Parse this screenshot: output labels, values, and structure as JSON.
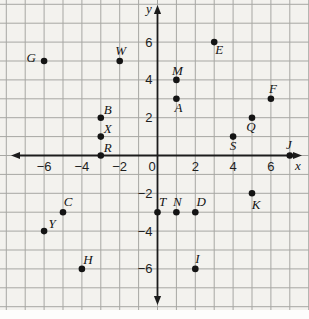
{
  "figure": {
    "name": "coordinate-plane-with-labeled-points",
    "colors": {
      "paper": "#f3f2ee",
      "grid": "#a7a7a3",
      "axis": "#1c1c1c",
      "point": "#141414",
      "margin": "#fdfdfc"
    }
  },
  "chart_data": {
    "type": "scatter",
    "title": "",
    "xlabel": "x",
    "ylabel": "y",
    "xlim": [
      -8,
      8
    ],
    "ylim": [
      -8,
      8
    ],
    "grid": true,
    "x_tick_labels": [
      {
        "value": -6,
        "text": "−6"
      },
      {
        "value": -4,
        "text": "−4"
      },
      {
        "value": -2,
        "text": "−2"
      },
      {
        "value": 0,
        "text": "0"
      },
      {
        "value": 2,
        "text": "2"
      },
      {
        "value": 4,
        "text": "4"
      },
      {
        "value": 6,
        "text": "6"
      }
    ],
    "y_tick_labels": [
      {
        "value": 6,
        "text": "6"
      },
      {
        "value": 4,
        "text": "4"
      },
      {
        "value": 2,
        "text": "2"
      },
      {
        "value": -2,
        "text": "−2"
      },
      {
        "value": -4,
        "text": "−4"
      },
      {
        "value": -6,
        "text": "−6"
      }
    ],
    "points": [
      {
        "label": "G",
        "x": -6,
        "y": 5,
        "label_offset": [
          -13,
          1
        ]
      },
      {
        "label": "W",
        "x": -2,
        "y": 5,
        "label_offset": [
          1,
          -6
        ]
      },
      {
        "label": "E",
        "x": 3,
        "y": 6,
        "label_offset": [
          5,
          12
        ]
      },
      {
        "label": "M",
        "x": 1,
        "y": 4,
        "label_offset": [
          1,
          -5
        ]
      },
      {
        "label": "A",
        "x": 1,
        "y": 3,
        "label_offset": [
          2,
          13
        ]
      },
      {
        "label": "F",
        "x": 6,
        "y": 3,
        "label_offset": [
          2,
          -6
        ]
      },
      {
        "label": "B",
        "x": -3,
        "y": 2,
        "label_offset": [
          7,
          -4
        ]
      },
      {
        "label": "X",
        "x": -3,
        "y": 1,
        "label_offset": [
          7,
          -4
        ]
      },
      {
        "label": "R",
        "x": -3,
        "y": 0,
        "label_offset": [
          7,
          -4
        ]
      },
      {
        "label": "Q",
        "x": 5,
        "y": 2,
        "label_offset": [
          -1,
          13
        ]
      },
      {
        "label": "S",
        "x": 4,
        "y": 1,
        "label_offset": [
          0,
          13
        ]
      },
      {
        "label": "J",
        "x": 7,
        "y": 0,
        "label_offset": [
          -1,
          -7
        ]
      },
      {
        "label": "C",
        "x": -5,
        "y": -3,
        "label_offset": [
          5,
          -6
        ]
      },
      {
        "label": "Y",
        "x": -6,
        "y": -4,
        "label_offset": [
          8,
          -3
        ]
      },
      {
        "label": "T",
        "x": 0,
        "y": -3,
        "label_offset": [
          5,
          -6
        ]
      },
      {
        "label": "N",
        "x": 1,
        "y": -3,
        "label_offset": [
          1,
          -6
        ]
      },
      {
        "label": "D",
        "x": 2,
        "y": -3,
        "label_offset": [
          6,
          -6
        ]
      },
      {
        "label": "K",
        "x": 5,
        "y": -2,
        "label_offset": [
          4,
          16
        ]
      },
      {
        "label": "H",
        "x": -4,
        "y": -6,
        "label_offset": [
          6,
          -5
        ]
      },
      {
        "label": "I",
        "x": 2,
        "y": -6,
        "label_offset": [
          2,
          -6
        ]
      }
    ]
  }
}
